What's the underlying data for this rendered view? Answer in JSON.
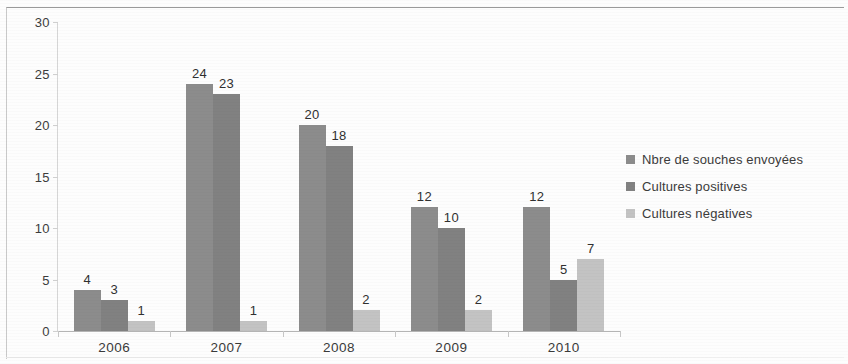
{
  "chart_data": {
    "type": "bar",
    "title": "",
    "subtitle": "",
    "xlabel": "",
    "ylabel": "",
    "categories": [
      "2006",
      "2007",
      "2008",
      "2009",
      "2010"
    ],
    "series": [
      {
        "name": "Nbre de souches envoyées",
        "color": "#8c8c8c",
        "values": [
          4,
          24,
          20,
          12,
          12
        ]
      },
      {
        "name": "Cultures positives",
        "color": "#818181",
        "values": [
          3,
          23,
          18,
          10,
          5
        ]
      },
      {
        "name": "Cultures négatives",
        "color": "#c3c3c3",
        "values": [
          1,
          1,
          2,
          2,
          7
        ]
      }
    ],
    "ylim": [
      0,
      30
    ],
    "ytick_labels": [
      "0",
      "5",
      "10",
      "15",
      "20",
      "25",
      "30"
    ],
    "ytick_values": [
      0,
      5,
      10,
      15,
      20,
      25,
      30
    ],
    "grid": false,
    "legend_position": "right",
    "data_labels": true
  },
  "legend": {
    "items": [
      {
        "label": "Nbre de souches envoyées",
        "color": "#8c8c8c"
      },
      {
        "label": "Cultures positives",
        "color": "#818181"
      },
      {
        "label": "Cultures négatives",
        "color": "#c3c3c3"
      }
    ]
  }
}
